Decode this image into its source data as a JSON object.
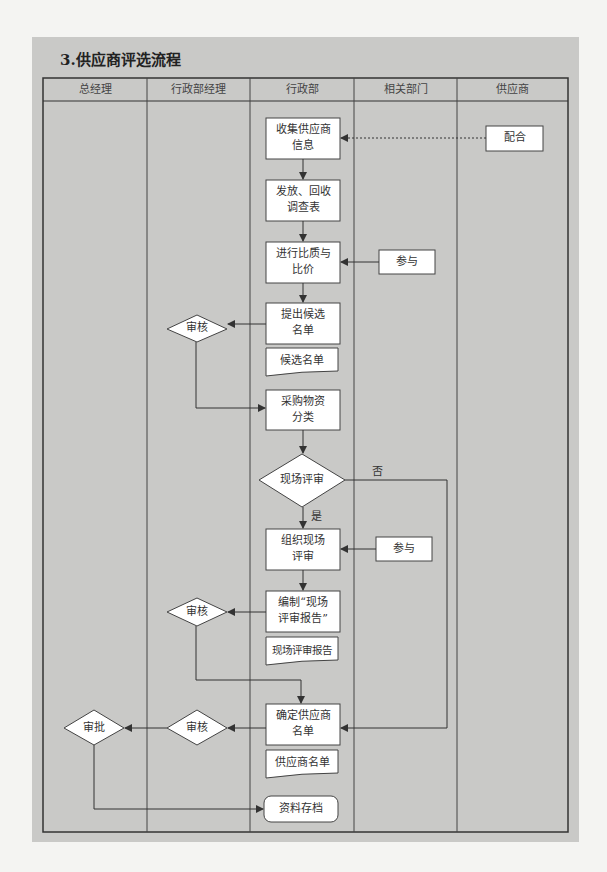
{
  "title": "3.供应商评选流程",
  "lanes": [
    "总经理",
    "行政部经理",
    "行政部",
    "相关部门",
    "供应商"
  ],
  "nodes": {
    "collect": "收集供应商信息",
    "collect_l1": "收集供应商",
    "collect_l2": "信息",
    "survey_l1": "发放、回收",
    "survey_l2": "调查表",
    "compare_l1": "进行比质与",
    "compare_l2": "比价",
    "shortlist_l1": "提出候选",
    "shortlist_l2": "名单",
    "shortlist_doc": "候选名单",
    "classify_l1": "采购物资",
    "classify_l2": "分类",
    "onsite_decision": "现场评审",
    "organize_l1": "组织现场",
    "organize_l2": "评审",
    "report_l1": "编制“现场",
    "report_l2": "评审报告”",
    "report_doc": "现场评审报告",
    "confirm_l1": "确定供应商",
    "confirm_l2": "名单",
    "supplier_doc": "供应商名单",
    "archive": "资料存档",
    "cooperate": "配合",
    "participate_1": "参与",
    "participate_2": "参与",
    "review_1": "审核",
    "review_2": "审核",
    "review_3": "审核",
    "approve": "审批"
  },
  "edge_labels": {
    "no": "否",
    "yes": "是"
  }
}
